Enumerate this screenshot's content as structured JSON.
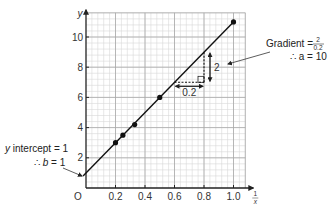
{
  "chart_data": {
    "type": "scatter",
    "title": "",
    "xlabel_num": "1",
    "xlabel_den": "x",
    "ylabel": "y",
    "origin_label": "O",
    "xlim": [
      0,
      1.1
    ],
    "ylim": [
      0,
      11.8
    ],
    "x_ticks": [
      0.2,
      0.4,
      0.6,
      0.8,
      1.0
    ],
    "x_tick_labels": [
      "0.2",
      "0.4",
      "0.6",
      "0.8",
      "1.0"
    ],
    "y_ticks": [
      2,
      4,
      6,
      8,
      10
    ],
    "y_tick_labels": [
      "2",
      "4",
      "6",
      "8",
      "10"
    ],
    "grid": true,
    "grid_minor_x": 0.04,
    "grid_minor_y": 0.4,
    "series": [
      {
        "name": "data",
        "x": [
          0.2,
          0.25,
          0.33,
          0.5,
          1.0
        ],
        "y": [
          3,
          3.5,
          4.2,
          6,
          11
        ]
      }
    ],
    "best_fit_line": {
      "gradient": 10,
      "intercept": 1,
      "x_range": [
        -0.02,
        1.0
      ]
    },
    "gradient_triangle": {
      "x0": 0.6,
      "x1": 0.8,
      "y0": 7,
      "y1": 9,
      "run_label": "0.2",
      "rise_label": "2"
    },
    "annotations": {
      "gradient_text": "Gradient = ",
      "gradient_num": "2",
      "gradient_den": "0.2",
      "a_text": "∴ a = 10",
      "intercept_text_var": "y",
      "intercept_text": " intercept = 1",
      "b_text_prefix": "∴ ",
      "b_text_var": "b",
      "b_text_suffix": " = 1"
    },
    "footer_text": "Sample values shown"
  },
  "colors": {
    "grid_minor": "#d9d9d9",
    "grid_major": "#a8a8a8",
    "axis": "#222222",
    "line": "#111111",
    "point": "#111111"
  }
}
